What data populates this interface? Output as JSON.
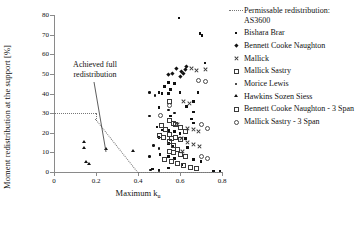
{
  "chart_data": {
    "type": "scatter",
    "title": "",
    "xlabel": "Maximum k",
    "xlabel_sub": "u",
    "ylabel": "Moment redistribution at the support [%]",
    "xlim": [
      0,
      0.8
    ],
    "ylim": [
      0,
      80
    ],
    "xticks": [
      "0",
      "0.2",
      "0.4",
      "0.6",
      "0.8"
    ],
    "xtick_values": [
      0,
      0.2,
      0.4,
      0.6,
      0.8
    ],
    "yticks": [
      "0",
      "10",
      "20",
      "30",
      "40",
      "50",
      "60",
      "70",
      "80"
    ],
    "ytick_values": [
      0,
      10,
      20,
      30,
      40,
      50,
      60,
      70,
      80
    ],
    "grid": false,
    "legend_position": "right",
    "annotations": [
      {
        "text": "Achieved full redistribution",
        "x": 0.16,
        "y": 50
      }
    ],
    "reference_line": {
      "name": "Permissable redistribution: AS3600",
      "style": "dotted",
      "points": [
        [
          0.0,
          30
        ],
        [
          0.2,
          30
        ],
        [
          0.2,
          27
        ],
        [
          0.4,
          0
        ],
        [
          0.8,
          0
        ]
      ]
    },
    "series": [
      {
        "name": "Bishara Brar",
        "marker": "filled-square",
        "points": [
          [
            0.595,
            78.5
          ],
          [
            0.695,
            70.5
          ],
          [
            0.705,
            69.5
          ],
          [
            0.72,
            55.5
          ],
          [
            0.545,
            45.5
          ],
          [
            0.575,
            45.0
          ],
          [
            0.525,
            43.5
          ],
          [
            0.555,
            42.0
          ],
          [
            0.5,
            40.5
          ],
          [
            0.515,
            40.0
          ],
          [
            0.545,
            40.0
          ],
          [
            0.6,
            40.5
          ],
          [
            0.685,
            40.5
          ],
          [
            0.665,
            36.0
          ],
          [
            0.5,
            33.0
          ],
          [
            0.63,
            33.5
          ],
          [
            0.665,
            30.5
          ],
          [
            0.655,
            27.0
          ],
          [
            0.555,
            28.5
          ],
          [
            0.665,
            25.0
          ],
          [
            0.49,
            23.0
          ],
          [
            0.515,
            21.5
          ],
          [
            0.545,
            21.0
          ],
          [
            0.575,
            20.5
          ],
          [
            0.6,
            19.5
          ],
          [
            0.5,
            17.5
          ],
          [
            0.625,
            17.0
          ],
          [
            0.545,
            14.5
          ],
          [
            0.565,
            13.0
          ],
          [
            0.635,
            12.5
          ],
          [
            0.505,
            9.0
          ],
          [
            0.545,
            8.0
          ],
          [
            0.575,
            7.0
          ],
          [
            0.665,
            6.5
          ],
          [
            0.7,
            5.5
          ],
          [
            0.61,
            3.5
          ],
          [
            0.545,
            2.0
          ],
          [
            0.47,
            1.5
          ],
          [
            0.5,
            1.0
          ],
          [
            0.76,
            0.5
          ],
          [
            0.79,
            0.5
          ]
        ]
      },
      {
        "name": "Bennett Cooke Naughton",
        "marker": "filled-diamond",
        "points": [
          [
            0.585,
            53.0
          ],
          [
            0.605,
            51.5
          ],
          [
            0.625,
            52.5
          ],
          [
            0.63,
            54.0
          ],
          [
            0.615,
            50.0
          ],
          [
            0.6,
            48.5
          ],
          [
            0.565,
            50.5
          ],
          [
            0.545,
            49.5
          ]
        ]
      },
      {
        "name": "Mallick",
        "marker": "cross",
        "points": [
          [
            0.655,
            52.5
          ],
          [
            0.68,
            51.5
          ],
          [
            0.72,
            52.0
          ],
          [
            0.615,
            36.0
          ],
          [
            0.645,
            35.0
          ],
          [
            0.59,
            24.0
          ],
          [
            0.635,
            22.0
          ],
          [
            0.665,
            21.5
          ],
          [
            0.69,
            20.5
          ],
          [
            0.605,
            17.0
          ],
          [
            0.635,
            15.0
          ],
          [
            0.665,
            14.0
          ],
          [
            0.695,
            13.0
          ],
          [
            0.61,
            10.5
          ]
        ]
      },
      {
        "name": "Mallick Sastry",
        "marker": "open-square",
        "points": [
          [
            0.545,
            36.0
          ],
          [
            0.575,
            24.5
          ],
          [
            0.6,
            23.0
          ],
          [
            0.625,
            21.0
          ],
          [
            0.545,
            19.5
          ],
          [
            0.575,
            18.0
          ],
          [
            0.6,
            17.0
          ],
          [
            0.545,
            16.0
          ],
          [
            0.565,
            14.0
          ],
          [
            0.585,
            12.0
          ],
          [
            0.545,
            11.0
          ],
          [
            0.565,
            10.0
          ],
          [
            0.6,
            9.0
          ],
          [
            0.625,
            8.0
          ],
          [
            0.525,
            6.5
          ],
          [
            0.555,
            5.5
          ],
          [
            0.585,
            4.5
          ],
          [
            0.615,
            3.5
          ],
          [
            0.645,
            2.5
          ],
          [
            0.675,
            2.0
          ]
        ]
      },
      {
        "name": "Morice Lewis",
        "marker": "filled-circle",
        "points": [
          [
            0.455,
            28.5
          ],
          [
            0.475,
            13.5
          ],
          [
            0.5,
            12.0
          ],
          [
            0.455,
            8.0
          ],
          [
            0.545,
            31.5
          ],
          [
            0.575,
            30.0
          ],
          [
            0.455,
            40.5
          ],
          [
            0.48,
            39.0
          ],
          [
            0.46,
            1.0
          ],
          [
            0.5,
            0.8
          ]
        ]
      },
      {
        "name": "Hawkins Sozen Siess",
        "marker": "triangle",
        "points": [
          [
            0.145,
            15.0
          ],
          [
            0.145,
            12.0
          ],
          [
            0.155,
            5.0
          ],
          [
            0.165,
            4.0
          ],
          [
            0.25,
            11.5
          ],
          [
            0.375,
            10.5
          ]
        ]
      },
      {
        "name": "Bennett Cooke Naughton - 3 Span",
        "marker": "open-square-small",
        "points": [
          [
            0.545,
            26.5
          ],
          [
            0.565,
            25.0
          ],
          [
            0.51,
            24.0
          ],
          [
            0.53,
            22.0
          ],
          [
            0.5,
            19.0
          ],
          [
            0.52,
            18.0
          ],
          [
            0.555,
            17.5
          ]
        ]
      },
      {
        "name": "Mallick Sastry - 3 Span",
        "marker": "open-circle",
        "points": [
          [
            0.685,
            47.0
          ],
          [
            0.72,
            46.5
          ],
          [
            0.7,
            24.5
          ],
          [
            0.73,
            22.5
          ],
          [
            0.545,
            34.0
          ],
          [
            0.505,
            29.0
          ],
          [
            0.7,
            8.0
          ],
          [
            0.73,
            7.0
          ]
        ]
      }
    ]
  },
  "legend": {
    "items": [
      {
        "label": "Permissable redistribution: AS3600",
        "marker": "dotted-line"
      },
      {
        "label": "Bishara Brar",
        "marker": "filled-square"
      },
      {
        "label": "Bennett Cooke Naughton",
        "marker": "filled-diamond"
      },
      {
        "label": "Mallick",
        "marker": "cross"
      },
      {
        "label": "Mallick Sastry",
        "marker": "open-square"
      },
      {
        "label": "Morice Lewis",
        "marker": "filled-circle"
      },
      {
        "label": "Hawkins Sozen Siess",
        "marker": "triangle"
      },
      {
        "label": "Bennett Cooke Naughton - 3 Span",
        "marker": "open-square-small"
      },
      {
        "label": "Mallick Sastry - 3 Span",
        "marker": "open-circle"
      }
    ]
  }
}
